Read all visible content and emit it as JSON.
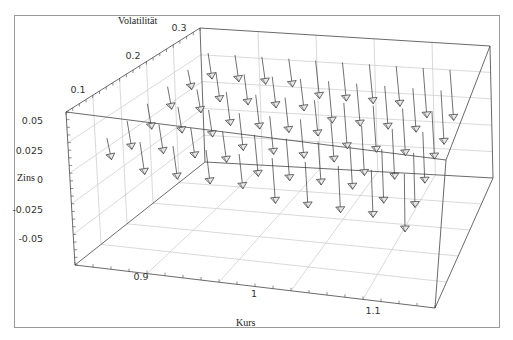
{
  "chart_data": {
    "type": "scatter",
    "subtype": "3d-vector-field",
    "title": "",
    "axes": {
      "x": {
        "label": "Kurs",
        "ticks": [
          "0.9",
          "1",
          "1.1"
        ],
        "range": [
          0.85,
          1.15
        ]
      },
      "y": {
        "label": "Volatilität",
        "ticks": [
          "0.1",
          "0.2",
          "0.3"
        ],
        "range": [
          0.05,
          0.3
        ]
      },
      "z": {
        "label": "Zins",
        "ticks": [
          "0.05",
          "0.025",
          "0",
          "-0.025",
          "-0.05"
        ],
        "range": [
          -0.06,
          0.06
        ]
      }
    },
    "grid": true,
    "box": true,
    "colors": {
      "arrow": "#333333",
      "box": "#444444",
      "grid": "#c8c8c8",
      "frame": "#9a9a9a"
    }
  },
  "labels": {
    "x_axis": "Kurs",
    "y_axis": "Volatilität",
    "z_axis": "Zins"
  },
  "ticks": {
    "x": [
      "0.9",
      "1",
      "1.1"
    ],
    "y": [
      "0.1",
      "0.2",
      "0.3"
    ],
    "z": [
      "0.05",
      "0.025",
      "0",
      "-0.025",
      "-0.05"
    ]
  }
}
